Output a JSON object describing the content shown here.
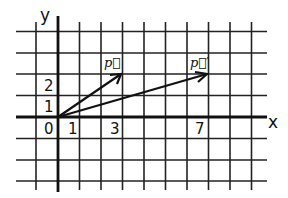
{
  "diagram": {
    "type": "coordinate-grid-vectors",
    "axes": {
      "x_label": "x",
      "y_label": "y",
      "origin_label": "0"
    },
    "tick_labels": {
      "x": [
        "1",
        "3",
        "7"
      ],
      "y": [
        "1",
        "2"
      ]
    },
    "vectors": [
      {
        "name": "p",
        "label": "p⃗",
        "from": [
          0,
          0
        ],
        "to": [
          3,
          2
        ]
      },
      {
        "name": "p_prime",
        "label": "p⃗′",
        "from": [
          0,
          0
        ],
        "to": [
          7,
          2
        ]
      }
    ],
    "grid": {
      "x_range": [
        -1,
        9
      ],
      "y_range": [
        -3,
        4
      ],
      "unit_px": 21.5
    }
  }
}
